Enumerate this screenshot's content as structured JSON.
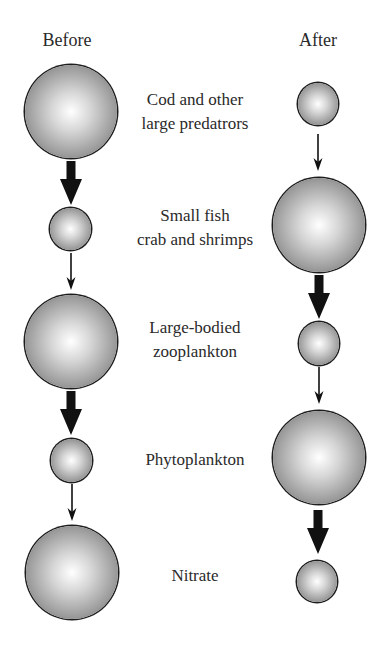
{
  "headings": {
    "before": "Before",
    "after": "After"
  },
  "levels": [
    {
      "label_lines": [
        "Cod and other",
        "large predatrors"
      ],
      "before_size": "large",
      "after_size": "small"
    },
    {
      "label_lines": [
        "Small fish",
        "crab and shrimps"
      ],
      "before_size": "small",
      "after_size": "large"
    },
    {
      "label_lines": [
        "Large-bodied",
        "zooplankton"
      ],
      "before_size": "large",
      "after_size": "small"
    },
    {
      "label_lines": [
        "Phytoplankton"
      ],
      "before_size": "small",
      "after_size": "large"
    },
    {
      "label_lines": [
        "Nitrate"
      ],
      "before_size": "large",
      "after_size": "small"
    }
  ],
  "arrows": {
    "before": [
      "thick",
      "thin",
      "thick",
      "thin"
    ],
    "after": [
      "thin",
      "thick",
      "thin",
      "thick"
    ]
  },
  "colors": {
    "arrow": "#111111",
    "sphere_highlight": "#ffffff",
    "sphere_edge": "#1e1e1e",
    "text": "#2a2a2a"
  }
}
